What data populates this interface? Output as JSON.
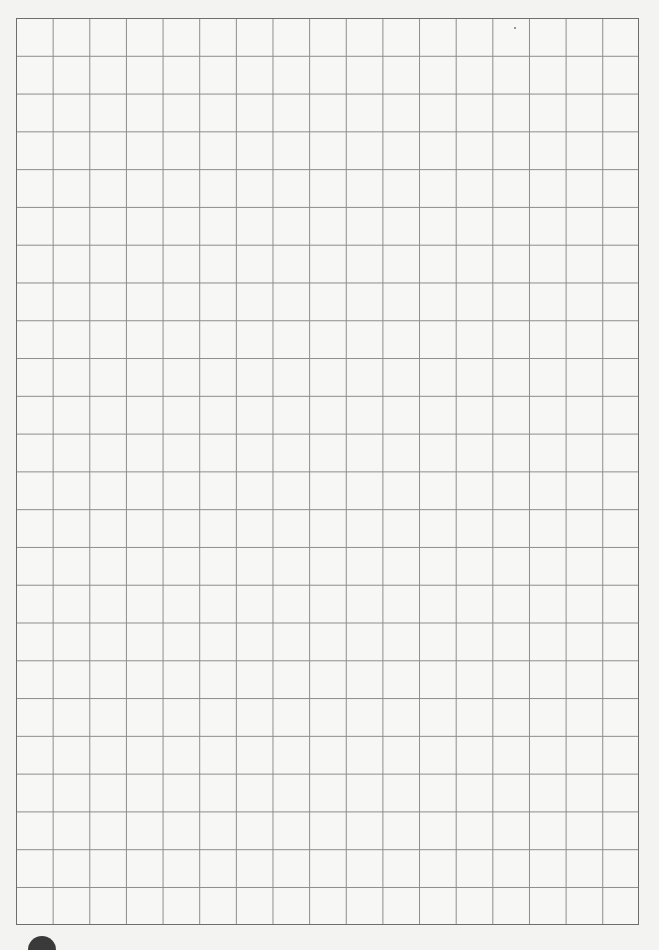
{
  "page": {
    "type": "grid-paper",
    "background_color": "#f3f3f1",
    "line_color": "#8c8c8c",
    "border_color": "#6e6e6e"
  },
  "grid": {
    "columns": 17,
    "rows": 24,
    "left": 16,
    "top": 18,
    "width": 623,
    "height": 907
  },
  "marks": [
    {
      "kind": "dark-semicircle",
      "x": 28,
      "y": 936
    },
    {
      "kind": "speck",
      "x": 514,
      "y": 27
    }
  ]
}
